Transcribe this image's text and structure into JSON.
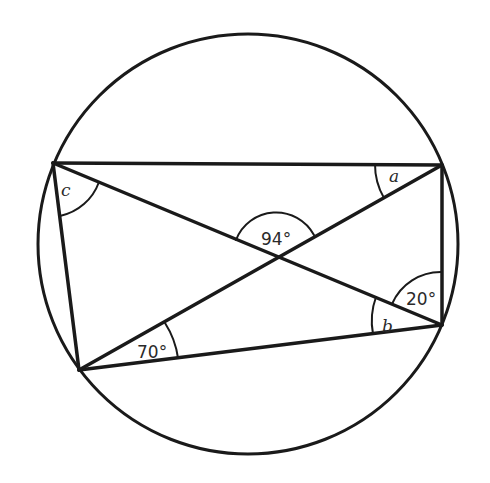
{
  "diagram": {
    "type": "cyclic-quadrilateral-with-diagonals",
    "circle": {
      "cx": 248,
      "cy": 244,
      "r": 210
    },
    "vertices": {
      "top_left": [
        53,
        163
      ],
      "top_right": [
        442,
        165
      ],
      "bottom_right": [
        442,
        325
      ],
      "bottom_left": [
        79,
        370
      ]
    },
    "diagonal_intersection": [
      276,
      256
    ],
    "angle_labels": {
      "a": "a",
      "b": "b",
      "c": "c",
      "intersection": "94°",
      "bottom_left": "70°",
      "right": "20°"
    },
    "colors": {
      "stroke": "#1a1a1a",
      "text": "#2a2a2a",
      "background": "#ffffff"
    }
  }
}
